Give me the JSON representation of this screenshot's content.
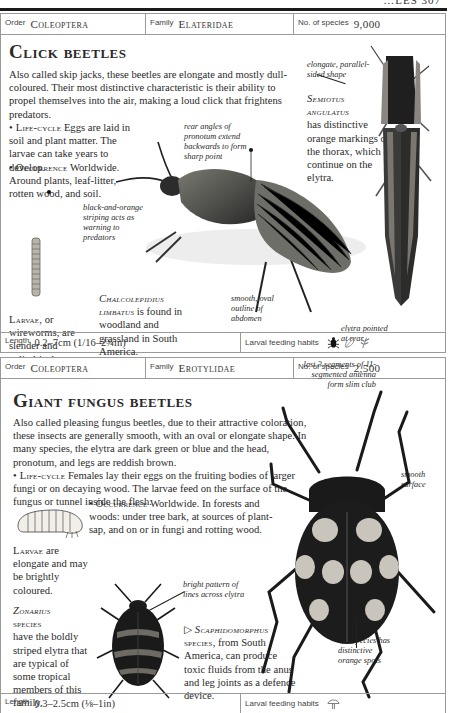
{
  "running_header": {
    "text": "…LES  307"
  },
  "entries": [
    {
      "info": {
        "order_label": "Order",
        "order": "Coleoptera",
        "family_label": "Family",
        "family": "Elateridae",
        "species_label": "No. of species",
        "species_count": "9,000"
      },
      "title": "Click beetles",
      "intro": "Also called skip jacks, these beetles are elongate and mostly dull-coloured. Their most distinctive characteristic is their ability to propel themselves into the air, making a loud click that frightens predators.",
      "lifecycle_label": "Life-cycle",
      "lifecycle_text": "Eggs are laid in soil and plant matter. The larvae can take years to develop.",
      "occurrence_label": "Occurrence",
      "occurrence_text": "Worldwide. Around plants, leaf-litter, rotten wood, and soil.",
      "larvae_caption_label": "Larvae",
      "larvae_caption_text": ", or wireworms, are slender and cylindrical.",
      "species_captions": [
        {
          "name": "Chalcolepidius limbatus",
          "text": " is found in woodland and grassland in South America."
        },
        {
          "name": "Semiotus angulatus",
          "text": " has distinctive orange markings on the thorax, which continue on the elytra."
        }
      ],
      "annotations": [
        "rear angles of pronotum extend backwards to form sharp point",
        "black-and-orange striping acts as warning to predators",
        "smooth, oval outline of abdomen",
        "elongate, parallel-sided shape",
        "elytra pointed at rear"
      ],
      "footer": {
        "length_label": "Length",
        "length_value": "0.2–7cm (1/16–2¾in)",
        "habits_label": "Larval feeding habits",
        "habit_icons": [
          "beetle-icon",
          "leaf-icon",
          "plant-icon"
        ]
      }
    },
    {
      "info": {
        "order_label": "Order",
        "order": "Coleoptera",
        "family_label": "Family",
        "family": "Erotylidae",
        "species_label": "No. of species",
        "species_count": "2,500"
      },
      "title": "Giant fungus beetles",
      "intro": "Also called pleasing fungus beetles, due to their attractive coloration, these insects are generally smooth, with an oval or elongate shape. In many species, the elytra are dark green or blue and the head, pronotum, and legs are reddish brown.",
      "lifecycle_label": "Life-cycle",
      "lifecycle_text": "Females lay their eggs on the fruiting bodies of larger fungi or on decaying wood. The larvae feed on the surface of the fungus or tunnel inside the flesh.",
      "occurrence_label": "Occurrence",
      "occurrence_text": "Worldwide. In forests and woods: under tree bark, at sources of plant-sap, and on or in fungi and rotting wood.",
      "larvae_caption_label": "Larvae",
      "larvae_caption_text": " are elongate and may be brightly coloured.",
      "species_captions": [
        {
          "name": "Zonarius",
          "name2": "species",
          "text": "have the boldly striped elytra that are typical of some tropical members of this family."
        },
        {
          "prefix": "▷ ",
          "name": "Scaphidomorphus",
          "name2": "species",
          "text": ", from South America, can produce toxic fluids from the anus and leg joints as a defence device."
        }
      ],
      "annotations": [
        "last 3 segments of 11-segmented antenna form slim club",
        "smooth surface",
        "bright pattern of lines across elytra",
        "this species has distinctive orange spots"
      ],
      "footer": {
        "length_label": "Length",
        "length_value": "0.3–2.5cm (⅛–1in)",
        "habits_label": "Larval feeding habits",
        "habit_icons": [
          "mushroom-icon"
        ]
      }
    }
  ],
  "colors": {
    "text": "#2a2a2a",
    "border": "#9a9a9a",
    "beetle_dark": "#1c1c1c",
    "spot_orange": "#c9c4bc"
  }
}
